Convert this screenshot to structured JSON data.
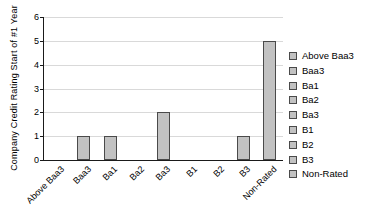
{
  "chart_data": {
    "type": "bar",
    "categories": [
      "Above Baa3",
      "Baa3",
      "Ba1",
      "Ba2",
      "Ba3",
      "B1",
      "B2",
      "B3",
      "Non-Rated"
    ],
    "values": [
      0,
      1,
      1,
      0,
      2,
      0,
      0,
      1,
      5
    ],
    "title": "",
    "xlabel": "",
    "ylabel": "Company Credit Rating Start of #1 Year",
    "ylim": [
      0,
      6
    ],
    "ytick_step": 1,
    "yticks": [
      0,
      1,
      2,
      3,
      4,
      5,
      6
    ],
    "grid": true,
    "legend_position": "right",
    "legend_entries": [
      "Above Baa3",
      "Baa3",
      "Ba1",
      "Ba2",
      "Ba3",
      "B1",
      "B2",
      "B3",
      "Non-Rated"
    ],
    "colors": {
      "bar_fill": "#c2c2c2",
      "bar_border": "#4a4a4a",
      "gridline": "#d9d9d9",
      "axis": "#1a1a1a",
      "text": "#000000",
      "background": "#ffffff"
    }
  }
}
